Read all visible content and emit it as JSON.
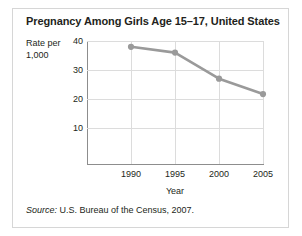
{
  "figure": {
    "title": "Pregnancy Among Girls Age 15–17, United States",
    "source_label": "Source:",
    "source_text": " U.S. Bureau of the Census, 2007.",
    "border_color": "#d6d6d6"
  },
  "chart_data": {
    "type": "line",
    "title": "Pregnancy Among Girls Age 15–17, United States",
    "xlabel": "Year",
    "ylabel": "Rate per 1,000",
    "ylabel_line1": "Rate per",
    "ylabel_line2": "1,000",
    "x": [
      1990,
      1995,
      2000,
      2005
    ],
    "categories": [
      "1990",
      "1995",
      "2000",
      "2005"
    ],
    "values": [
      38,
      36,
      27,
      21.7
    ],
    "series": [
      {
        "name": "Pregnancy rate per 1,000 girls age 15-17",
        "values": [
          38,
          36,
          27,
          21.7
        ]
      }
    ],
    "xlim": [
      1987.5,
      2007.5
    ],
    "ylim": [
      0,
      42
    ],
    "yticks": [
      10,
      20,
      30,
      40
    ],
    "ytick_labels": [
      "10",
      "20",
      "30",
      "40"
    ],
    "xticks": [
      1990,
      1995,
      2000,
      2005
    ],
    "xtick_labels": [
      "1990",
      "1995",
      "2000",
      "2005"
    ],
    "grid": true,
    "legend": "none",
    "line_color": "#9a9a9a",
    "marker_color": "#9a9a9a",
    "grid_color": "#dcdcdc",
    "axis_color": "#8d8d8d"
  }
}
